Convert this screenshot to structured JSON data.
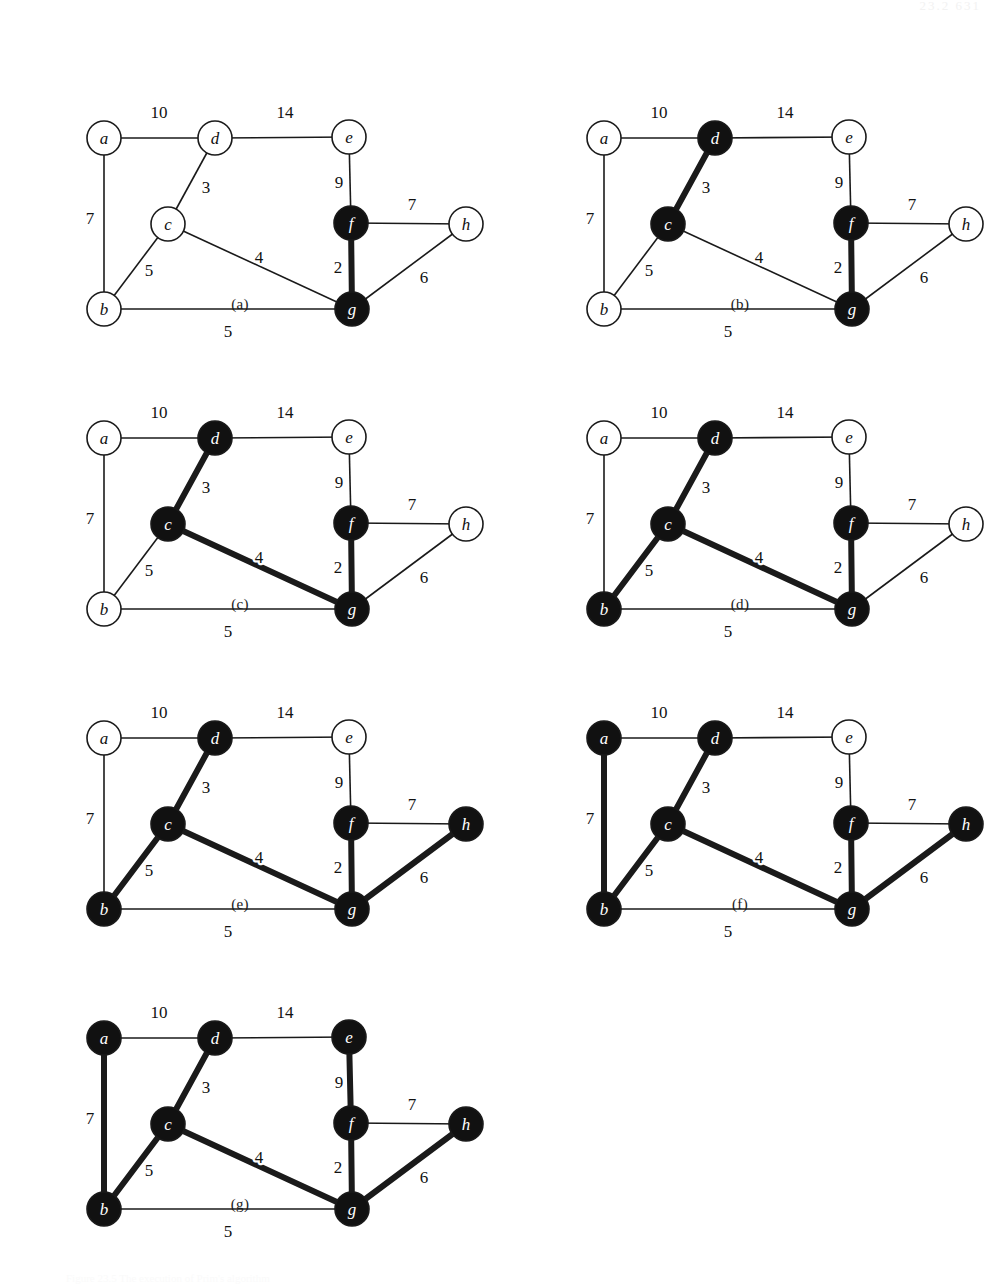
{
  "header": {
    "running_head": "23.2   631"
  },
  "footer": {
    "note": "Figure 23.5 The execution of Prim's algorithm"
  },
  "graph": {
    "nodes": [
      {
        "id": "a",
        "label": "a",
        "x": 74,
        "y": 92
      },
      {
        "id": "b",
        "label": "b",
        "x": 74,
        "y": 263
      },
      {
        "id": "c",
        "label": "c",
        "x": 138,
        "y": 178
      },
      {
        "id": "d",
        "label": "d",
        "x": 185,
        "y": 92
      },
      {
        "id": "e",
        "label": "e",
        "x": 319,
        "y": 91
      },
      {
        "id": "f",
        "label": "f",
        "x": 321,
        "y": 177
      },
      {
        "id": "g",
        "label": "g",
        "x": 322,
        "y": 263
      },
      {
        "id": "h",
        "label": "h",
        "x": 436,
        "y": 178
      }
    ],
    "node_radius": 17,
    "edges": [
      {
        "id": "a-d",
        "from": "a",
        "to": "d",
        "weight": "10",
        "lx": 129,
        "ly": 66
      },
      {
        "id": "d-e",
        "from": "d",
        "to": "e",
        "weight": "14",
        "lx": 255,
        "ly": 66
      },
      {
        "id": "a-b",
        "from": "a",
        "to": "b",
        "weight": "7",
        "lx": 60,
        "ly": 172
      },
      {
        "id": "c-d",
        "from": "c",
        "to": "d",
        "weight": "3",
        "lx": 176,
        "ly": 141
      },
      {
        "id": "e-f",
        "from": "e",
        "to": "f",
        "weight": "9",
        "lx": 309,
        "ly": 136
      },
      {
        "id": "f-h",
        "from": "f",
        "to": "h",
        "weight": "7",
        "lx": 382,
        "ly": 158
      },
      {
        "id": "b-c",
        "from": "b",
        "to": "c",
        "weight": "5",
        "lx": 119,
        "ly": 224
      },
      {
        "id": "c-g",
        "from": "c",
        "to": "g",
        "weight": "4",
        "lx": 229,
        "ly": 211
      },
      {
        "id": "f-g",
        "from": "f",
        "to": "g",
        "weight": "2",
        "lx": 308,
        "ly": 221
      },
      {
        "id": "g-h",
        "from": "g",
        "to": "h",
        "weight": "6",
        "lx": 394,
        "ly": 231
      },
      {
        "id": "b-g",
        "from": "b",
        "to": "g",
        "weight": "5",
        "lx": 198,
        "ly": 285
      }
    ]
  },
  "style": {
    "node_fill_visited": "#111111",
    "node_fill_unvisited": "#ffffff",
    "node_stroke": "#1a1a1a",
    "label_fill_on_dark": "#ffffff",
    "label_fill_on_light": "#111111",
    "edge_color": "#1a1a1a",
    "edge_width_normal": 1.6,
    "edge_width_tree": 6
  },
  "panels": [
    {
      "id": "a",
      "caption": "(a)",
      "left": 30,
      "top": 46,
      "caption_left": 210,
      "caption_top": 296,
      "black_nodes": [
        "f",
        "g"
      ],
      "tree_edges": [
        "f-g"
      ]
    },
    {
      "id": "b",
      "caption": "(b)",
      "left": 530,
      "top": 46,
      "caption_left": 710,
      "caption_top": 296,
      "black_nodes": [
        "c",
        "d",
        "f",
        "g"
      ],
      "tree_edges": [
        "c-d",
        "f-g"
      ]
    },
    {
      "id": "c",
      "caption": "(c)",
      "left": 30,
      "top": 346,
      "caption_left": 210,
      "caption_top": 596,
      "black_nodes": [
        "c",
        "d",
        "f",
        "g"
      ],
      "tree_edges": [
        "c-d",
        "c-g",
        "f-g"
      ]
    },
    {
      "id": "d",
      "caption": "(d)",
      "left": 530,
      "top": 346,
      "caption_left": 710,
      "caption_top": 596,
      "black_nodes": [
        "b",
        "c",
        "d",
        "f",
        "g"
      ],
      "tree_edges": [
        "b-c",
        "c-d",
        "c-g",
        "f-g"
      ]
    },
    {
      "id": "e",
      "caption": "(e)",
      "left": 30,
      "top": 646,
      "caption_left": 210,
      "caption_top": 896,
      "black_nodes": [
        "b",
        "c",
        "d",
        "f",
        "g",
        "h"
      ],
      "tree_edges": [
        "b-c",
        "c-d",
        "c-g",
        "f-g",
        "g-h"
      ]
    },
    {
      "id": "f",
      "caption": "(f)",
      "left": 530,
      "top": 646,
      "caption_left": 710,
      "caption_top": 896,
      "black_nodes": [
        "a",
        "b",
        "c",
        "d",
        "f",
        "g",
        "h"
      ],
      "tree_edges": [
        "a-b",
        "b-c",
        "c-d",
        "c-g",
        "f-g",
        "g-h"
      ]
    },
    {
      "id": "g",
      "caption": "(g)",
      "left": 30,
      "top": 946,
      "caption_left": 210,
      "caption_top": 1196,
      "black_nodes": [
        "a",
        "b",
        "c",
        "d",
        "e",
        "f",
        "g",
        "h"
      ],
      "tree_edges": [
        "a-b",
        "b-c",
        "c-d",
        "c-g",
        "e-f",
        "f-g",
        "g-h"
      ]
    }
  ],
  "chart_data": {
    "type": "diagram",
    "vertices": [
      "a",
      "b",
      "c",
      "d",
      "e",
      "f",
      "g",
      "h"
    ],
    "weighted_edges": [
      {
        "u": "a",
        "v": "b",
        "w": 7
      },
      {
        "u": "a",
        "v": "d",
        "w": 10
      },
      {
        "u": "b",
        "v": "c",
        "w": 5
      },
      {
        "u": "b",
        "v": "g",
        "w": 5
      },
      {
        "u": "c",
        "v": "d",
        "w": 3
      },
      {
        "u": "c",
        "v": "g",
        "w": 4
      },
      {
        "u": "d",
        "v": "e",
        "w": 14
      },
      {
        "u": "e",
        "v": "f",
        "w": 9
      },
      {
        "u": "f",
        "v": "g",
        "w": 2
      },
      {
        "u": "f",
        "v": "h",
        "w": 7
      },
      {
        "u": "g",
        "v": "h",
        "w": 6
      }
    ],
    "steps": [
      {
        "panel": "(a)",
        "in_tree_vertices": [
          "f",
          "g"
        ],
        "tree_edges": [
          [
            "f",
            "g",
            2
          ]
        ]
      },
      {
        "panel": "(b)",
        "in_tree_vertices": [
          "c",
          "d",
          "f",
          "g"
        ],
        "tree_edges": [
          [
            "f",
            "g",
            2
          ],
          [
            "c",
            "d",
            3
          ]
        ]
      },
      {
        "panel": "(c)",
        "in_tree_vertices": [
          "c",
          "d",
          "f",
          "g"
        ],
        "tree_edges": [
          [
            "f",
            "g",
            2
          ],
          [
            "c",
            "d",
            3
          ],
          [
            "c",
            "g",
            4
          ]
        ]
      },
      {
        "panel": "(d)",
        "in_tree_vertices": [
          "b",
          "c",
          "d",
          "f",
          "g"
        ],
        "tree_edges": [
          [
            "f",
            "g",
            2
          ],
          [
            "c",
            "d",
            3
          ],
          [
            "c",
            "g",
            4
          ],
          [
            "b",
            "c",
            5
          ]
        ]
      },
      {
        "panel": "(e)",
        "in_tree_vertices": [
          "b",
          "c",
          "d",
          "f",
          "g",
          "h"
        ],
        "tree_edges": [
          [
            "f",
            "g",
            2
          ],
          [
            "c",
            "d",
            3
          ],
          [
            "c",
            "g",
            4
          ],
          [
            "b",
            "c",
            5
          ],
          [
            "g",
            "h",
            6
          ]
        ]
      },
      {
        "panel": "(f)",
        "in_tree_vertices": [
          "a",
          "b",
          "c",
          "d",
          "f",
          "g",
          "h"
        ],
        "tree_edges": [
          [
            "f",
            "g",
            2
          ],
          [
            "c",
            "d",
            3
          ],
          [
            "c",
            "g",
            4
          ],
          [
            "b",
            "c",
            5
          ],
          [
            "g",
            "h",
            6
          ],
          [
            "a",
            "b",
            7
          ]
        ]
      },
      {
        "panel": "(g)",
        "in_tree_vertices": [
          "a",
          "b",
          "c",
          "d",
          "e",
          "f",
          "g",
          "h"
        ],
        "tree_edges": [
          [
            "f",
            "g",
            2
          ],
          [
            "c",
            "d",
            3
          ],
          [
            "c",
            "g",
            4
          ],
          [
            "b",
            "c",
            5
          ],
          [
            "g",
            "h",
            6
          ],
          [
            "a",
            "b",
            7
          ],
          [
            "e",
            "f",
            9
          ]
        ]
      }
    ],
    "total_mst_weight": 36
  }
}
